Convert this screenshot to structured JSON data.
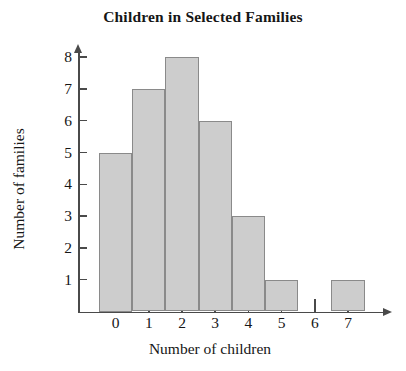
{
  "chart_data": {
    "type": "bar",
    "title": "Children in Selected Families",
    "xlabel": "Number of children",
    "ylabel": "Number of families",
    "categories": [
      "0",
      "1",
      "2",
      "3",
      "4",
      "5",
      "6",
      "7"
    ],
    "values": [
      5,
      7,
      8,
      6,
      3,
      1,
      0,
      1
    ],
    "xlim": [
      -0.5,
      7.5
    ],
    "ylim": [
      0,
      8
    ],
    "ytick_labels": [
      "1",
      "2",
      "3",
      "4",
      "5",
      "6",
      "7",
      "8"
    ],
    "ytick_values": [
      1,
      2,
      3,
      4,
      5,
      6,
      7,
      8
    ],
    "xtick_labels": [
      "0",
      "1",
      "2",
      "3",
      "4",
      "5",
      "6",
      "7"
    ],
    "grid": false,
    "legend": false,
    "bar_fill_color": "#cdcdcd",
    "bar_border_color": "#8a8a8a",
    "axis_color": "#4a4a4a",
    "text_color": "#161616"
  }
}
